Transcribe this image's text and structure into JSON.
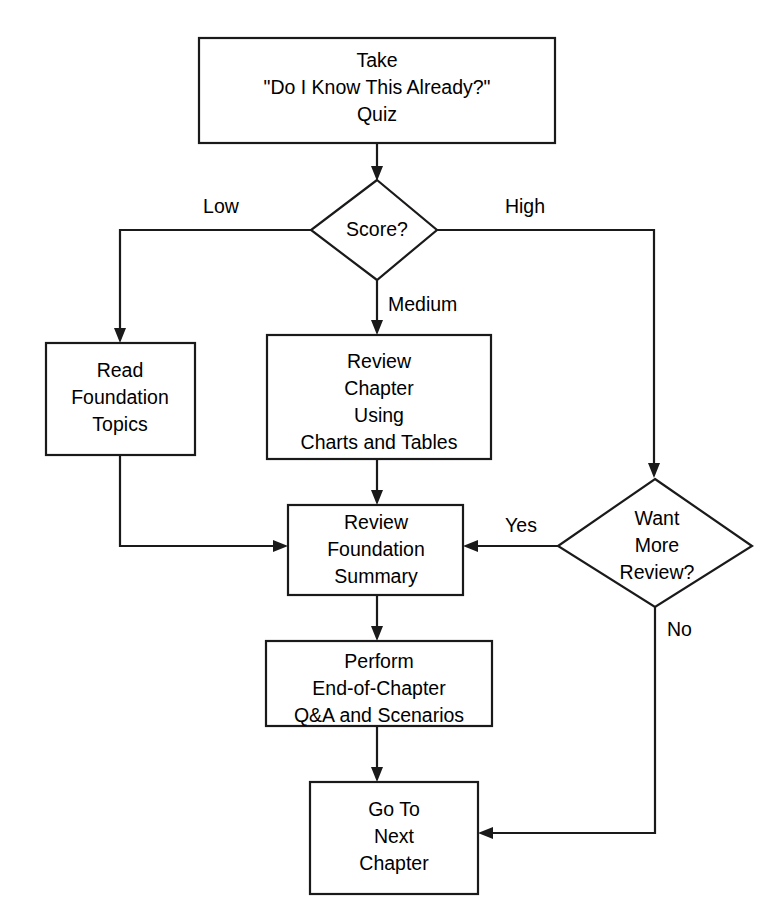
{
  "diagram": {
    "type": "flowchart",
    "background_color": "#ffffff",
    "line_color": "#1a1a1a",
    "text_color": "#000000"
  },
  "nodes": [
    {
      "id": "take-quiz",
      "shape": "process",
      "lines": [
        "Take",
        "\"Do I Know This Already?\"",
        "Quiz"
      ],
      "line1": "Take",
      "line2": "\"Do I Know This Already?\"",
      "line3": "Quiz"
    },
    {
      "id": "score-decision",
      "shape": "decision",
      "lines": [
        "Score?"
      ],
      "line1": "Score?"
    },
    {
      "id": "read-foundation-topics",
      "shape": "process",
      "lines": [
        "Read",
        "Foundation",
        "Topics"
      ],
      "line1": "Read",
      "line2": "Foundation",
      "line3": "Topics"
    },
    {
      "id": "review-chapter",
      "shape": "process",
      "lines": [
        "Review",
        "Chapter",
        "Using",
        "Charts and Tables"
      ],
      "line1": "Review",
      "line2": "Chapter",
      "line3": "Using",
      "line4": "Charts and Tables"
    },
    {
      "id": "review-foundation-summary",
      "shape": "process",
      "lines": [
        "Review",
        "Foundation",
        "Summary"
      ],
      "line1": "Review",
      "line2": "Foundation",
      "line3": "Summary"
    },
    {
      "id": "want-more-review",
      "shape": "decision",
      "lines": [
        "Want",
        "More",
        "Review?"
      ],
      "line1": "Want",
      "line2": "More",
      "line3": "Review?"
    },
    {
      "id": "perform-qa",
      "shape": "process",
      "lines": [
        "Perform",
        "End-of-Chapter",
        "Q&A and Scenarios"
      ],
      "line1": "Perform",
      "line2": "End-of-Chapter",
      "line3": "Q&A and Scenarios"
    },
    {
      "id": "go-to-next-chapter",
      "shape": "process",
      "lines": [
        "Go To",
        "Next",
        "Chapter"
      ],
      "line1": "Go To",
      "line2": "Next",
      "line3": "Chapter"
    }
  ],
  "edge_labels": {
    "low": "Low",
    "medium": "Medium",
    "high": "High",
    "yes": "Yes",
    "no": "No"
  },
  "edges": [
    {
      "from": "take-quiz",
      "to": "score-decision",
      "label": ""
    },
    {
      "from": "score-decision",
      "to": "read-foundation-topics",
      "label": "Low"
    },
    {
      "from": "score-decision",
      "to": "review-chapter",
      "label": "Medium"
    },
    {
      "from": "score-decision",
      "to": "want-more-review",
      "label": "High"
    },
    {
      "from": "read-foundation-topics",
      "to": "review-foundation-summary",
      "label": ""
    },
    {
      "from": "review-chapter",
      "to": "review-foundation-summary",
      "label": ""
    },
    {
      "from": "want-more-review",
      "to": "review-foundation-summary",
      "label": "Yes"
    },
    {
      "from": "want-more-review",
      "to": "go-to-next-chapter",
      "label": "No"
    },
    {
      "from": "review-foundation-summary",
      "to": "perform-qa",
      "label": ""
    },
    {
      "from": "perform-qa",
      "to": "go-to-next-chapter",
      "label": ""
    }
  ]
}
